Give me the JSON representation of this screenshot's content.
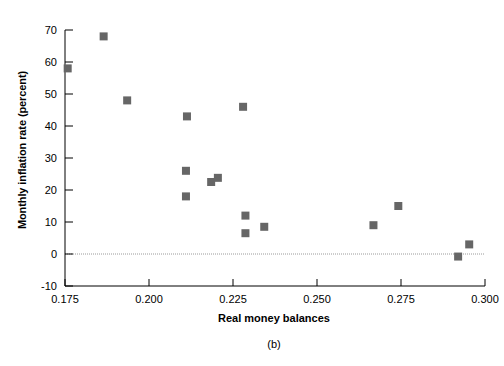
{
  "chart_data": {
    "type": "scatter",
    "title": "",
    "caption": "(b)",
    "xlabel": "Real money balances",
    "ylabel": "Monthly inflation rate (percent)",
    "xlim": [
      0.175,
      0.3
    ],
    "ylim": [
      -10,
      70
    ],
    "xticks": [
      "0.175",
      "0.200",
      "0.225",
      "0.250",
      "0.275",
      "0.300"
    ],
    "xtick_values": [
      0.175,
      0.2,
      0.225,
      0.25,
      0.275,
      0.3
    ],
    "yticks": [
      "70",
      "60",
      "50",
      "40",
      "30",
      "20",
      "10",
      "0",
      "-10"
    ],
    "ytick_values": [
      70,
      60,
      50,
      40,
      30,
      20,
      10,
      0,
      -10
    ],
    "grid": false,
    "legend": null,
    "zero_line": true,
    "marker": "square",
    "marker_color": "#666666",
    "axis_color": "#000000",
    "points": [
      {
        "x": 0.1758,
        "y": 58
      },
      {
        "x": 0.1865,
        "y": 68
      },
      {
        "x": 0.1935,
        "y": 48
      },
      {
        "x": 0.2113,
        "y": 43
      },
      {
        "x": 0.211,
        "y": 26
      },
      {
        "x": 0.211,
        "y": 18
      },
      {
        "x": 0.2185,
        "y": 22.5
      },
      {
        "x": 0.2205,
        "y": 23.8
      },
      {
        "x": 0.228,
        "y": 46
      },
      {
        "x": 0.2287,
        "y": 12
      },
      {
        "x": 0.2287,
        "y": 6.5
      },
      {
        "x": 0.2343,
        "y": 8.5
      },
      {
        "x": 0.2668,
        "y": 9
      },
      {
        "x": 0.2742,
        "y": 15
      },
      {
        "x": 0.292,
        "y": -0.8
      },
      {
        "x": 0.2953,
        "y": 3
      }
    ]
  }
}
